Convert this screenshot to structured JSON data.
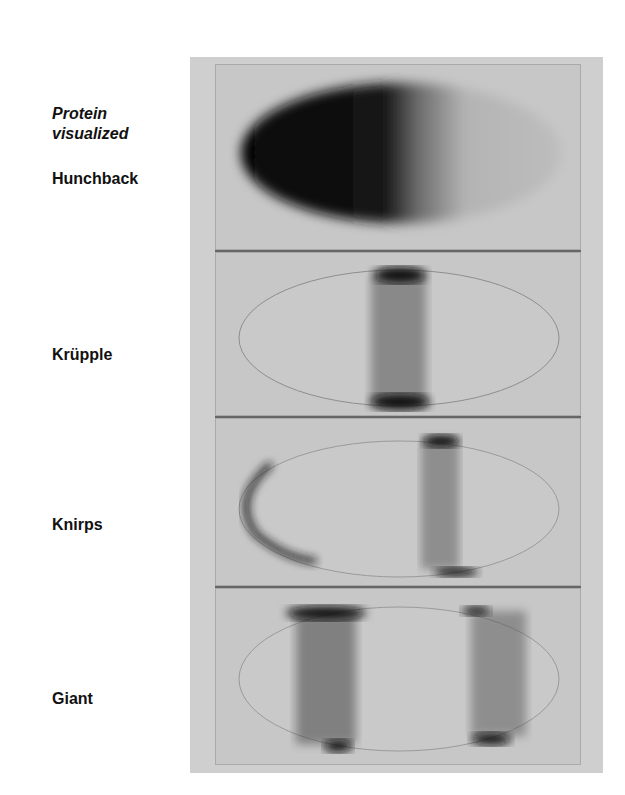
{
  "figure": {
    "header": {
      "line1": "Protein",
      "line2": "visualized"
    },
    "panels": [
      {
        "label": "Hunchback",
        "pattern": "anterior gradient"
      },
      {
        "label": "Krüpple",
        "pattern": "central stripe"
      },
      {
        "label": "Knirps",
        "pattern": "anterior cap and posterior-central stripe"
      },
      {
        "label": "Giant",
        "pattern": "two stripes"
      }
    ],
    "colors": {
      "frame": "#cfcfcf",
      "panel": "#c7c7c7",
      "stain": "#111111",
      "divider": "#666666"
    }
  }
}
